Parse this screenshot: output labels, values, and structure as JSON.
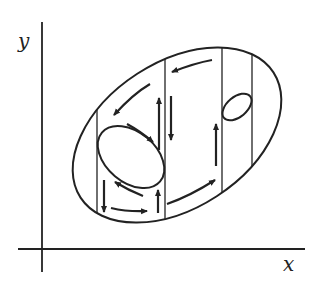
{
  "diagram": {
    "type": "phase-portrait",
    "axes": {
      "x_label": "x",
      "y_label": "y"
    },
    "regions": {
      "outer_boundary": "ellipse",
      "inner_boundaries": [
        "large-ellipse-left",
        "small-ellipse-right"
      ],
      "vertical_dividers": 4
    },
    "arrows": [
      {
        "location": "top-arc-right",
        "direction": "left"
      },
      {
        "location": "top-arc-left",
        "direction": "down-left"
      },
      {
        "location": "inner-ellipse-upper-right",
        "direction": "down-right"
      },
      {
        "location": "divider-2-left",
        "direction": "up"
      },
      {
        "location": "divider-2-right",
        "direction": "down"
      },
      {
        "location": "divider-1-bottom",
        "direction": "down"
      },
      {
        "location": "inner-ellipse-lower",
        "direction": "up-left"
      },
      {
        "location": "bottom-channel",
        "direction": "right"
      },
      {
        "location": "divider-2-bottom",
        "direction": "up"
      },
      {
        "location": "bottom-arc-right",
        "direction": "up-right"
      },
      {
        "location": "divider-3",
        "direction": "up"
      }
    ],
    "colors": {
      "stroke": "#222222",
      "background": "#ffffff"
    }
  }
}
